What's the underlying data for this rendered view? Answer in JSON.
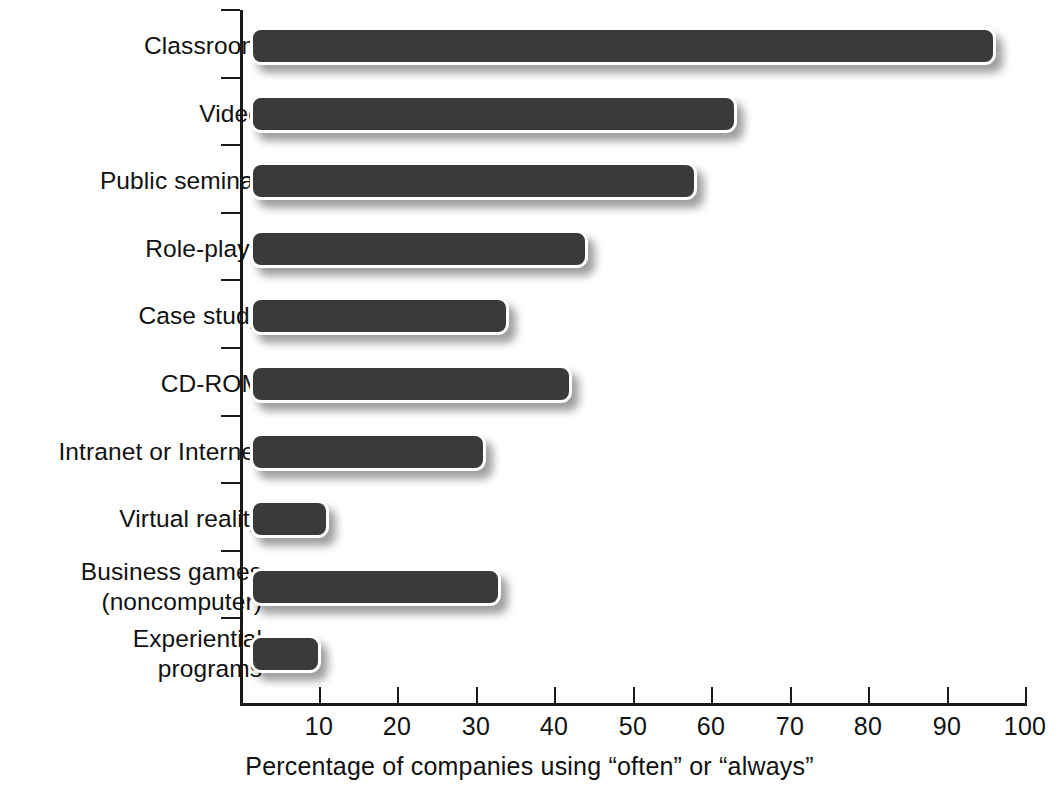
{
  "chart_data": {
    "type": "bar",
    "orientation": "horizontal",
    "title": "",
    "xlabel": "Percentage of companies using “often” or “always”",
    "ylabel": "",
    "xlim": [
      0,
      100
    ],
    "xticks": [
      10,
      20,
      30,
      40,
      50,
      60,
      70,
      80,
      90,
      100
    ],
    "xtick_labels": [
      "10",
      "20",
      "30",
      "40",
      "50",
      "60",
      "70",
      "80",
      "90",
      "100"
    ],
    "grid": false,
    "legend": null,
    "categories": [
      "Classroom",
      "Video",
      "Public seminar",
      "Role-plays",
      "Case study",
      "CD-ROM",
      "Intranet or Internet",
      "Virtual reality",
      "Business games\n(noncomputer)",
      "Experiential\nprograms"
    ],
    "values": [
      95,
      62,
      57,
      43,
      33,
      41,
      30,
      10,
      32,
      9
    ],
    "bar_color": "#3a3a3a",
    "background_color": "#ffffff",
    "axis_color": "#1a1a1a"
  },
  "categories_display": [
    {
      "lines": [
        "Classroom"
      ]
    },
    {
      "lines": [
        "Video"
      ]
    },
    {
      "lines": [
        "Public seminar"
      ]
    },
    {
      "lines": [
        "Role-plays"
      ]
    },
    {
      "lines": [
        "Case study"
      ]
    },
    {
      "lines": [
        "CD-ROM"
      ]
    },
    {
      "lines": [
        "Intranet or Internet"
      ]
    },
    {
      "lines": [
        "Virtual reality"
      ]
    },
    {
      "lines": [
        "Business games",
        "(noncomputer)"
      ]
    },
    {
      "lines": [
        "Experiential",
        "programs"
      ]
    }
  ]
}
